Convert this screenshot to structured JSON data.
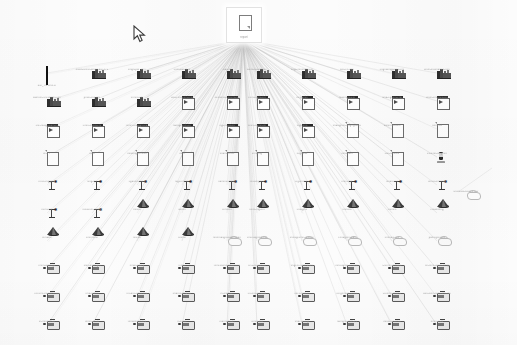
{
  "view": {
    "title": "Data Lineage Graph",
    "background_color": "#fcfcfc",
    "edge_color": "#b6b6b6",
    "zoom_level": "Fit",
    "width": 517,
    "height": 345
  },
  "cursor": {
    "name": "mouse-pointer",
    "x": 133,
    "y": 25
  },
  "hub": {
    "icon": "document-icon",
    "label": "report",
    "selected": true,
    "x": 243,
    "y": 24
  },
  "legend": {
    "icon_types": [
      "qr-code-icon",
      "industry-plant-icon",
      "document-arrow-icon",
      "document-icon",
      "stem-star-icon",
      "dark-cone-icon",
      "cloud-blob-icon",
      "device-monitor-icon",
      "phone-handset-icon"
    ]
  },
  "grid": {
    "columns_x": [
      47,
      92,
      137,
      182,
      227,
      257,
      302,
      347,
      392,
      437
    ],
    "rows_y": [
      68,
      96,
      124,
      152,
      180,
      208,
      236,
      264,
      292,
      320
    ]
  },
  "isolated_node": {
    "icon": "cloud-blob-icon",
    "label": "unlinked-source.csv",
    "x": 466,
    "y": 190
  },
  "nodes": [
    {
      "icon": "qr-code-icon",
      "label": "bar_TN.bmn.cl",
      "r": 0,
      "c": 0
    },
    {
      "icon": "industry-plant-icon",
      "label": "mass-afmct-bmgn.dat-972",
      "r": 0,
      "c": 1
    },
    {
      "icon": "industry-plant-icon",
      "label": "bngn-pdf_vert",
      "r": 0,
      "c": 2
    },
    {
      "icon": "industry-plant-icon",
      "label": "chnt-dat-hcm",
      "r": 0,
      "c": 3
    },
    {
      "icon": "industry-plant-icon",
      "label": "cldt-tnt",
      "r": 0,
      "c": 4
    },
    {
      "icon": "industry-plant-icon",
      "label": "barm-ds-bm-ntn",
      "r": 0,
      "c": 5
    },
    {
      "icon": "industry-plant-icon",
      "label": "cngt-lnhlfmmcs-hl",
      "r": 0,
      "c": 6
    },
    {
      "icon": "industry-plant-icon",
      "label": "wst-crt-lmp",
      "r": 0,
      "c": 7
    },
    {
      "icon": "industry-plant-icon",
      "label": "cngtfldmgg-ncs-cthl",
      "r": 0,
      "c": 8
    },
    {
      "icon": "industry-plant-icon",
      "label": "wsm-lncdffdmcs-hstl",
      "r": 0,
      "c": 9
    },
    {
      "icon": "industry-plant-icon",
      "label": "wdmtht-l.ncsmtms.cnn",
      "r": 1,
      "c": 0
    },
    {
      "icon": "industry-plant-icon",
      "label": "pndtl-cng-tml",
      "r": 1,
      "c": 1
    },
    {
      "icon": "industry-plant-icon",
      "label": "tnmhtl-cnt",
      "r": 1,
      "c": 2
    },
    {
      "icon": "document-arrow-icon",
      "label": "wst-cfm-lcmn-lcnl",
      "r": 1,
      "c": 3
    },
    {
      "icon": "document-arrow-icon",
      "label": "ncmbmn-cmtlhnt-hll",
      "r": 1,
      "c": 4
    },
    {
      "icon": "document-arrow-icon",
      "label": "cnms-tgml-cnl",
      "r": 1,
      "c": 5
    },
    {
      "icon": "document-arrow-icon",
      "label": "hmgdmts",
      "r": 1,
      "c": 6
    },
    {
      "icon": "document-arrow-icon",
      "label": "mdhmgnt-cnt",
      "r": 1,
      "c": 7
    },
    {
      "icon": "document-arrow-icon",
      "label": "smd-cgnmn-cml",
      "r": 1,
      "c": 8
    },
    {
      "icon": "document-arrow-icon",
      "label": "wnm-cmthncs-cnl",
      "r": 1,
      "c": 9
    },
    {
      "icon": "document-arrow-icon",
      "label": "cnc-mdtgnclbm-lnl",
      "r": 2,
      "c": 0
    },
    {
      "icon": "document-arrow-icon",
      "label": "clmn-lmndt-cnl",
      "r": 2,
      "c": 1
    },
    {
      "icon": "document-arrow-icon",
      "label": "fnmct-cndggnl-cdt",
      "r": 2,
      "c": 2
    },
    {
      "icon": "document-arrow-icon",
      "label": "nwmgcsnnt-cn",
      "r": 2,
      "c": 3
    },
    {
      "icon": "document-arrow-icon",
      "label": "hgt-lnscd-lhl",
      "r": 2,
      "c": 4
    },
    {
      "icon": "document-arrow-icon",
      "label": "wnm-lcgmn-lnl",
      "r": 2,
      "c": 5
    },
    {
      "icon": "document-arrow-icon",
      "label": "tltgnmhs",
      "r": 2,
      "c": 6
    },
    {
      "icon": "document-icon",
      "label": "tmddgmnt-lnhgng-lbhcl",
      "r": 2,
      "c": 7
    },
    {
      "icon": "document-icon",
      "label": "wlmnm-t-cdhl",
      "r": 2,
      "c": 8
    },
    {
      "icon": "document-icon",
      "label": "tlnmcsd",
      "r": 2,
      "c": 9
    },
    {
      "icon": "document-icon",
      "label": "lnt-PP",
      "r": 3,
      "c": 0
    },
    {
      "icon": "document-icon",
      "label": "hndt",
      "r": 3,
      "c": 1
    },
    {
      "icon": "document-icon",
      "label": "tnhdtmg-lcmncn",
      "r": 3,
      "c": 2
    },
    {
      "icon": "document-icon",
      "label": "lnmt",
      "r": 3,
      "c": 3
    },
    {
      "icon": "document-icon",
      "label": "flhdmcsnt-lt",
      "r": 3,
      "c": 4
    },
    {
      "icon": "document-icon",
      "label": "lnmdt-tg",
      "r": 3,
      "c": 5
    },
    {
      "icon": "document-icon",
      "label": "ncgmhdt",
      "r": 3,
      "c": 6
    },
    {
      "icon": "document-icon",
      "label": "lnmnsd-lt",
      "r": 3,
      "c": 7
    },
    {
      "icon": "document-icon",
      "label": "clnt-tcmn-nl",
      "r": 3,
      "c": 8
    },
    {
      "icon": "phone-handset-icon",
      "label": "cs-tcmt-lmtgmnt",
      "r": 3,
      "c": 9
    },
    {
      "icon": "stem-star-icon",
      "label": "lntcs-mggnhd",
      "r": 4,
      "c": 0
    },
    {
      "icon": "stem-star-icon",
      "label": "hlng-lntt",
      "r": 4,
      "c": 1
    },
    {
      "icon": "stem-star-icon",
      "label": "cgdnmt-lbhcs",
      "r": 4,
      "c": 2
    },
    {
      "icon": "stem-star-icon",
      "label": "hlgt-tnhcmt",
      "r": 4,
      "c": 3
    },
    {
      "icon": "stem-star-icon",
      "label": "hdmnsr-lmhcs",
      "r": 4,
      "c": 4
    },
    {
      "icon": "stem-star-icon",
      "label": "tlncdmgmhl",
      "r": 4,
      "c": 5
    },
    {
      "icon": "stem-star-icon",
      "label": "cfg-lnttmcs",
      "r": 4,
      "c": 6
    },
    {
      "icon": "stem-star-icon",
      "label": "nmn-lhdt",
      "r": 4,
      "c": 7
    },
    {
      "icon": "stem-star-icon",
      "label": "hmdnt-lcs",
      "r": 4,
      "c": 8
    },
    {
      "icon": "stem-star-icon",
      "label": "lnmst-lhnthhdt",
      "r": 4,
      "c": 9
    },
    {
      "icon": "stem-star-icon",
      "label": "hcmt-lntt",
      "r": 5,
      "c": 0
    },
    {
      "icon": "stem-star-icon",
      "label": "tnhdcsm-lhmng",
      "r": 5,
      "c": 1
    },
    {
      "icon": "dark-cone-icon",
      "label": "tnhcl-t",
      "r": 5,
      "c": 2
    },
    {
      "icon": "dark-cone-icon",
      "label": "lbhfml",
      "r": 5,
      "c": 3
    },
    {
      "icon": "dark-cone-icon",
      "label": "cfmcsnt",
      "r": 5,
      "c": 4
    },
    {
      "icon": "dark-cone-icon",
      "label": "hmtn-lng-cnt",
      "r": 5,
      "c": 5
    },
    {
      "icon": "dark-cone-icon",
      "label": "cnldgmn",
      "r": 5,
      "c": 6
    },
    {
      "icon": "dark-cone-icon",
      "label": "tlnmcdt",
      "r": 5,
      "c": 7
    },
    {
      "icon": "dark-cone-icon",
      "label": "chlmcs",
      "r": 5,
      "c": 8
    },
    {
      "icon": "dark-cone-icon",
      "label": "clhdmtnng",
      "r": 5,
      "c": 9
    },
    {
      "icon": "dark-cone-icon",
      "label": "lnmdblc",
      "r": 6,
      "c": 0
    },
    {
      "icon": "dark-cone-icon",
      "label": "clhnmtnst",
      "r": 6,
      "c": 1
    },
    {
      "icon": "dark-cone-icon",
      "label": "ftncsm",
      "r": 6,
      "c": 2
    },
    {
      "icon": "dark-cone-icon",
      "label": "lcnmst",
      "r": 6,
      "c": 3
    },
    {
      "icon": "cloud-blob-icon",
      "label": "mnmhdsgncsdblm-cdn",
      "r": 6,
      "c": 4
    },
    {
      "icon": "cloud-blob-icon",
      "label": "cmlcsdgttmc-hln",
      "r": 6,
      "c": 5
    },
    {
      "icon": "cloud-blob-icon",
      "label": "lmhdgcsmn-lmb-cln",
      "r": 6,
      "c": 6
    },
    {
      "icon": "cloud-blob-icon",
      "label": "cnhdgtmn-cds",
      "r": 6,
      "c": 7
    },
    {
      "icon": "cloud-blob-icon",
      "label": "lnmhdg-cstl",
      "r": 6,
      "c": 8
    },
    {
      "icon": "cloud-blob-icon",
      "label": "pdmcgsnt-clh",
      "r": 6,
      "c": 9
    },
    {
      "icon": "device-monitor-icon",
      "label": "nmm-dtlhc-gc",
      "r": 7,
      "c": 0
    },
    {
      "icon": "device-monitor-icon",
      "label": "smn-dtlhc-gcl",
      "r": 7,
      "c": 1
    },
    {
      "icon": "device-monitor-icon",
      "label": "nmdt-lcs-cg",
      "r": 7,
      "c": 2
    },
    {
      "icon": "device-monitor-icon",
      "label": "tcml-l",
      "r": 7,
      "c": 3
    },
    {
      "icon": "device-monitor-icon",
      "label": "thmcdslmn-lcfdtmcns",
      "r": 7,
      "c": 4
    },
    {
      "icon": "device-monitor-icon",
      "label": "lcs-l-ts-dhm-cl",
      "r": 7,
      "c": 5
    },
    {
      "icon": "device-monitor-icon",
      "label": "tmgcnl-tl-hncdsmc",
      "r": 7,
      "c": 6
    },
    {
      "icon": "device-monitor-icon",
      "label": "lnmcdgmn-lchtdms",
      "r": 7,
      "c": 7
    },
    {
      "icon": "device-monitor-icon",
      "label": "t-tcnms-lchdms",
      "r": 7,
      "c": 8
    },
    {
      "icon": "device-monitor-icon",
      "label": "tln-thmt-dcsnl-tlmtg",
      "r": 7,
      "c": 9
    },
    {
      "icon": "device-monitor-icon",
      "label": "cltncmt-lnt-tdmcnshl",
      "r": 8,
      "c": 0
    },
    {
      "icon": "device-monitor-icon",
      "label": "tmd-lcsnm",
      "r": 8,
      "c": 1
    },
    {
      "icon": "device-monitor-icon",
      "label": "tnt-dhc-cnl-lcmht",
      "r": 8,
      "c": 2
    },
    {
      "icon": "device-monitor-icon",
      "label": "lmdths-cmdt-cl",
      "r": 8,
      "c": 3
    },
    {
      "icon": "device-monitor-icon",
      "label": "m-lmnht-cl",
      "r": 8,
      "c": 4
    },
    {
      "icon": "device-monitor-icon",
      "label": "cn-lthc-cmt-ldh",
      "r": 8,
      "c": 5
    },
    {
      "icon": "device-monitor-icon",
      "label": "lmcs-ncdt-hl",
      "r": 8,
      "c": 6
    },
    {
      "icon": "device-monitor-icon",
      "label": "lcngmhtds-lchms",
      "r": 8,
      "c": 7
    },
    {
      "icon": "device-monitor-icon",
      "label": "t-tcmns-lhdtmc",
      "r": 8,
      "c": 8
    },
    {
      "icon": "device-monitor-icon",
      "label": "cdh-lnmt-tlcns-tmc-lns",
      "r": 8,
      "c": 9
    },
    {
      "icon": "device-monitor-icon",
      "label": "ln-tmndsht-cl",
      "r": 9,
      "c": 0
    },
    {
      "icon": "device-monitor-icon",
      "label": "lmhtn-dc-ts",
      "r": 9,
      "c": 1
    },
    {
      "icon": "device-monitor-icon",
      "label": "tmhdtmn-lnhcs",
      "r": 9,
      "c": 2
    },
    {
      "icon": "device-monitor-icon",
      "label": "lt-lndcs",
      "r": 9,
      "c": 3
    },
    {
      "icon": "device-monitor-icon",
      "label": "lhdtmcns-lcl",
      "r": 9,
      "c": 4
    },
    {
      "icon": "device-monitor-icon",
      "label": "lcmnt-lhd",
      "r": 9,
      "c": 5
    },
    {
      "icon": "device-monitor-icon",
      "label": "tmdcsn-lhgt",
      "r": 9,
      "c": 6
    },
    {
      "icon": "device-monitor-icon",
      "label": "hdmgns-lmnt-cs",
      "r": 9,
      "c": 7
    },
    {
      "icon": "device-monitor-icon",
      "label": "lmnh-dct-cmls",
      "r": 9,
      "c": 8
    },
    {
      "icon": "device-monitor-icon",
      "label": "nmht-lc-ts",
      "r": 9,
      "c": 9
    }
  ]
}
